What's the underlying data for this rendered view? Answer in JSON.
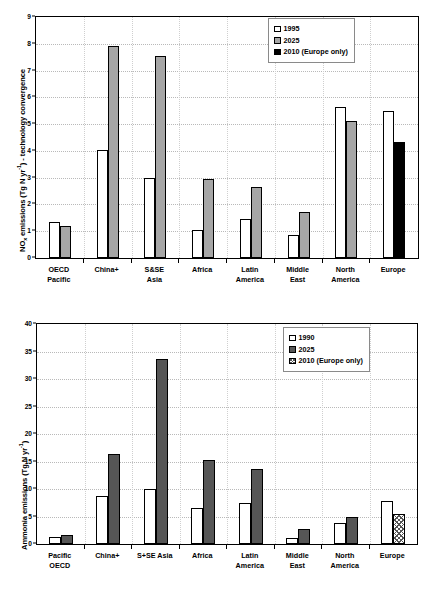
{
  "chart_data": [
    {
      "id": "nox",
      "type": "bar",
      "title": "",
      "xlabel": "",
      "ylabel": "NOx emissions (Tg N yr-1) - technology convergence",
      "ylabel_parts": {
        "pre": "NO",
        "sub": "x",
        "mid": " emissions (Tg N yr",
        "sup": "-1",
        "post": ") - technology convergence"
      },
      "ylim": [
        0,
        9
      ],
      "yticks": [
        0,
        1,
        2,
        3,
        4,
        5,
        6,
        7,
        8,
        9
      ],
      "ytick_labels": [
        "0",
        "1",
        "2",
        "3",
        "4",
        "5",
        "6",
        "7",
        "8",
        "9"
      ],
      "grid": true,
      "legend_position": "top-right",
      "categories": [
        "OECD\nPacific",
        "China+",
        "S&SE\nAsia",
        "Africa",
        "Latin\nAmerica",
        "Middle\nEast",
        "North\nAmerica",
        "Europe"
      ],
      "series": [
        {
          "name": "1995",
          "key": "s1995",
          "values": [
            1.35,
            4.05,
            3.0,
            1.05,
            1.45,
            0.85,
            5.65,
            5.5
          ]
        },
        {
          "name": "2025",
          "key": "s2025a",
          "values": [
            1.2,
            7.9,
            7.55,
            2.95,
            2.65,
            1.7,
            5.1,
            null
          ]
        },
        {
          "name": "2010 (Europe only)",
          "key": "s2010a",
          "values": [
            null,
            null,
            null,
            null,
            null,
            null,
            null,
            4.35
          ]
        }
      ]
    },
    {
      "id": "ammonia",
      "type": "bar",
      "title": "",
      "xlabel": "",
      "ylabel": "Ammonia emissions (Tg N yr-1)",
      "ylabel_parts": {
        "pre": "Ammonia emissions (Tg N yr",
        "sub": "",
        "mid": "",
        "sup": "-1",
        "post": ")"
      },
      "ylim": [
        0,
        40
      ],
      "yticks": [
        0,
        5,
        10,
        15,
        20,
        25,
        30,
        35,
        40
      ],
      "ytick_labels": [
        "0",
        "5",
        "10",
        "15",
        "20",
        "25",
        "30",
        "35",
        "40"
      ],
      "grid": true,
      "legend_position": "top-right",
      "categories": [
        "Pacific\nOECD",
        "China+",
        "S+SE Asia",
        "Africa",
        "Latin\nAmerica",
        "Middle\nEast",
        "North\nAmerica",
        "Europe"
      ],
      "series": [
        {
          "name": "1990",
          "key": "s1990",
          "values": [
            1.3,
            8.7,
            10.0,
            6.5,
            7.4,
            1.1,
            3.9,
            7.9
          ]
        },
        {
          "name": "2025",
          "key": "s2025b",
          "values": [
            1.7,
            16.3,
            33.6,
            15.2,
            13.6,
            2.8,
            4.9,
            null
          ]
        },
        {
          "name": "2010 (Europe only)",
          "key": "s2010b",
          "values": [
            null,
            null,
            null,
            null,
            null,
            null,
            null,
            5.4
          ]
        }
      ]
    }
  ]
}
